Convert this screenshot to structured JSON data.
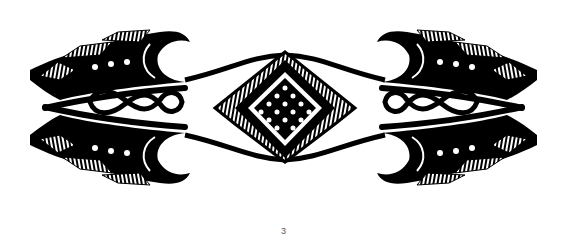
{
  "figure": {
    "caption_number": "3",
    "colors": {
      "ink": "#000000",
      "paper": "#ffffff"
    }
  }
}
